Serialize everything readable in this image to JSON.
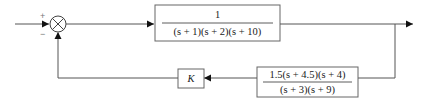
{
  "diagram": {
    "type": "feedback-control-block-diagram",
    "summing_junction": {
      "input_sign": "+",
      "feedback_sign": "−"
    },
    "forward_block": {
      "numerator": "1",
      "denominator": "(s + 1)(s  + 2)(s + 10)"
    },
    "feedback_gain_block": {
      "label": "K"
    },
    "feedback_block": {
      "numerator": "1.5(s + 4.5)(s + 4)",
      "denominator": "(s + 3)(s + 9)"
    }
  }
}
